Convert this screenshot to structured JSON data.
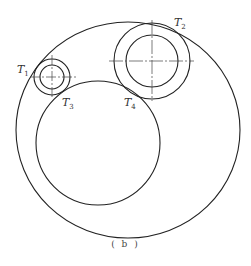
{
  "diagram": {
    "caption": "( b )",
    "labels": {
      "t1": {
        "letter": "T",
        "sub": "1"
      },
      "t2": {
        "letter": "T",
        "sub": "2"
      },
      "t3": {
        "letter": "T",
        "sub": "3"
      },
      "t4": {
        "letter": "T",
        "sub": "4"
      }
    },
    "colors": {
      "stroke": "#222222",
      "background": "#ffffff"
    }
  }
}
